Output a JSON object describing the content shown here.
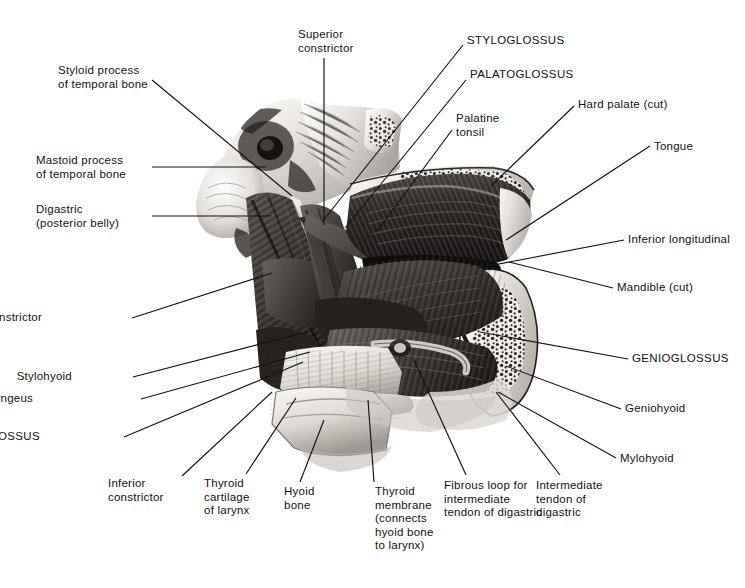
{
  "figure": {
    "caption": "Right side view",
    "signature": "DANK",
    "background_color": "#ffffff",
    "ink_color": "#121212",
    "width": 745,
    "height": 588
  },
  "labels": [
    {
      "id": "styloid-process",
      "text": "Styloid process\nof temporal bone",
      "align": "left",
      "x": 58,
      "y": 64,
      "leader": [
        [
          152,
          80
        ],
        [
          292,
          196
        ]
      ]
    },
    {
      "id": "superior-constrictor",
      "text": "Superior\nconstrictor",
      "align": "left",
      "x": 298,
      "y": 28,
      "leader": [
        [
          324,
          58
        ],
        [
          324,
          225
        ]
      ]
    },
    {
      "id": "styloglossus",
      "text": "STYLOGLOSSUS",
      "caps": true,
      "align": "left",
      "x": 467,
      "y": 34,
      "leader": [
        [
          463,
          45
        ],
        [
          322,
          222
        ]
      ]
    },
    {
      "id": "palatoglossus",
      "text": "PALATOGLOSSUS",
      "caps": true,
      "align": "left",
      "x": 470,
      "y": 68,
      "leader": [
        [
          466,
          80
        ],
        [
          345,
          228
        ]
      ]
    },
    {
      "id": "palatine-tonsil",
      "text": "Palatine\ntonsil",
      "align": "left",
      "x": 456,
      "y": 112,
      "leader": [
        [
          452,
          130
        ],
        [
          378,
          230
        ]
      ]
    },
    {
      "id": "hard-palate-cut",
      "text": "Hard palate (cut)",
      "align": "left",
      "x": 578,
      "y": 98,
      "leader": [
        [
          574,
          106
        ],
        [
          491,
          186
        ]
      ]
    },
    {
      "id": "tongue",
      "text": "Tongue",
      "align": "left",
      "x": 654,
      "y": 140,
      "leader": [
        [
          650,
          146
        ],
        [
          506,
          240
        ]
      ]
    },
    {
      "id": "mastoid-process",
      "text": "Mastoid process\nof temporal bone",
      "align": "left",
      "x": 36,
      "y": 154,
      "leader": [
        [
          152,
          167
        ],
        [
          266,
          167
        ]
      ]
    },
    {
      "id": "digastric-posterior-belly",
      "text": "Digastric\n(posterior belly)",
      "align": "left",
      "x": 36,
      "y": 203,
      "leader": [
        [
          152,
          216
        ],
        [
          271,
          216
        ]
      ]
    },
    {
      "id": "inferior-longitudinal",
      "text": "Inferior longitudinal",
      "align": "left",
      "x": 628,
      "y": 233,
      "leader": [
        [
          624,
          240
        ],
        [
          478,
          268
        ]
      ]
    },
    {
      "id": "mandible-cut",
      "text": "Mandible (cut)",
      "align": "left",
      "x": 617,
      "y": 281,
      "leader": [
        [
          613,
          288
        ],
        [
          509,
          262
        ]
      ]
    },
    {
      "id": "middle-constrictor",
      "text": "Middle constrictor",
      "align": "right",
      "x": 42,
      "y": 311,
      "leader": [
        [
          132,
          318
        ],
        [
          272,
          273
        ]
      ]
    },
    {
      "id": "stylohyoid",
      "text": "Stylohyoid",
      "align": "right",
      "x": 72,
      "y": 370,
      "leader": [
        [
          133,
          377
        ],
        [
          307,
          332
        ]
      ]
    },
    {
      "id": "stylopharyngeus",
      "text": "Stylopharyngeus",
      "align": "right",
      "x": 33,
      "y": 392,
      "leader": [
        [
          141,
          399
        ],
        [
          310,
          352
        ]
      ]
    },
    {
      "id": "genioglossus",
      "text": "GENIOGLOSSUS",
      "caps": true,
      "align": "left",
      "x": 632,
      "y": 352,
      "leader": [
        [
          628,
          359
        ],
        [
          480,
          332
        ]
      ]
    },
    {
      "id": "hyoglossus",
      "text": "HYOGLOSSUS",
      "caps": true,
      "align": "right",
      "x": 40,
      "y": 430,
      "leader": [
        [
          124,
          437
        ],
        [
          303,
          362
        ]
      ]
    },
    {
      "id": "geniohyoid",
      "text": "Geniohyoid",
      "align": "left",
      "x": 625,
      "y": 402,
      "leader": [
        [
          621,
          409
        ],
        [
          506,
          366
        ]
      ]
    },
    {
      "id": "mylohyoid",
      "text": "Mylohyoid",
      "align": "left",
      "x": 620,
      "y": 452,
      "leader": [
        [
          616,
          458
        ],
        [
          498,
          392
        ]
      ]
    },
    {
      "id": "inferior-constrictor",
      "text": "Inferior\nconstrictor",
      "align": "left",
      "x": 108,
      "y": 477,
      "leader": [
        [
          182,
          476
        ],
        [
          272,
          392
        ]
      ]
    },
    {
      "id": "thyroid-cartilage-of-larynx",
      "text": "Thyroid\ncartilage\nof larynx",
      "align": "left",
      "x": 204,
      "y": 477,
      "leader": [
        [
          246,
          474
        ],
        [
          296,
          398
        ]
      ]
    },
    {
      "id": "hyoid-bone",
      "text": "Hyoid\nbone",
      "align": "left",
      "x": 284,
      "y": 485,
      "leader": [
        [
          300,
          482
        ],
        [
          324,
          420
        ]
      ]
    },
    {
      "id": "thyroid-membrane",
      "text": "Thyroid\nmembrane\n(connects\nhyoid bone\nto larynx)",
      "align": "left",
      "x": 375,
      "y": 485,
      "leader": [
        [
          374,
          482
        ],
        [
          368,
          400
        ]
      ]
    },
    {
      "id": "fibrous-loop",
      "text": "Fibrous loop for\nintermediate\ntendon of digastric",
      "align": "left",
      "x": 444,
      "y": 479,
      "leader": [
        [
          466,
          475
        ],
        [
          414,
          360
        ]
      ]
    },
    {
      "id": "intermediate-tendon",
      "text": "Intermediate\ntendon of\ndigastric",
      "align": "left",
      "x": 536,
      "y": 479,
      "leader": [
        [
          560,
          475
        ],
        [
          496,
          392
        ]
      ]
    }
  ]
}
